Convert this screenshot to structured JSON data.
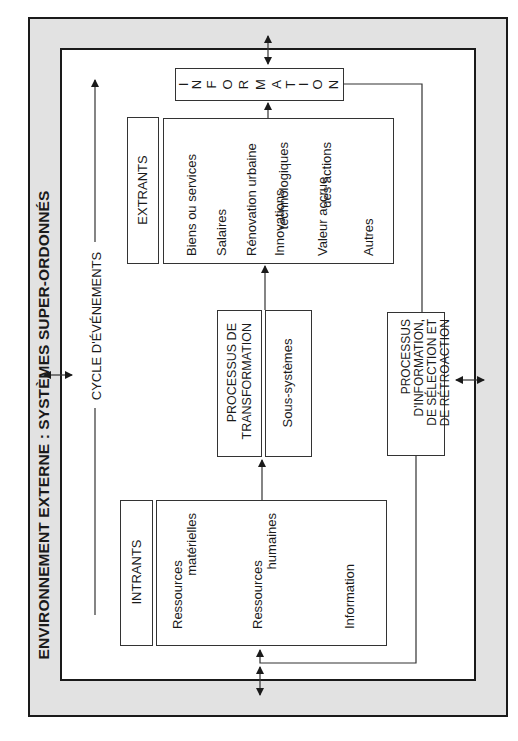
{
  "title": "ENVIRONNEMENT EXTERNE : SYSTÈMES SUPER-ORDONNÉS",
  "cycle_label": "CYCLE D'ÉVÉNEMENTS",
  "information_box": {
    "letters": [
      "I",
      "N",
      "F",
      "O",
      "R",
      "M",
      "A",
      "T",
      "I",
      "O",
      "N"
    ]
  },
  "extrants": {
    "label": "EXTRANTS",
    "items": [
      "Biens ou services",
      "Salaires",
      "Rénovation urbaine",
      "Innovations",
      "technologiques",
      "Valeur accrue",
      "des actions",
      "Autres"
    ]
  },
  "transformation": {
    "label_line1": "PROCESSUS DE",
    "label_line2": "TRANSFORMATION",
    "sub": "Sous-systèmes"
  },
  "intrants": {
    "label": "INTRANTS",
    "items": [
      "Ressources",
      "matérielles",
      "Ressources",
      "humaines",
      "Information"
    ]
  },
  "feedback": {
    "line1": "PROCESSUS",
    "line2": "D'INFORMATION,",
    "line3": "DE SÉLECTION ET",
    "line4": "DE RÉTROACTION"
  },
  "colors": {
    "frame_fill": "#e2e2e2",
    "line": "#1a1a1a"
  }
}
